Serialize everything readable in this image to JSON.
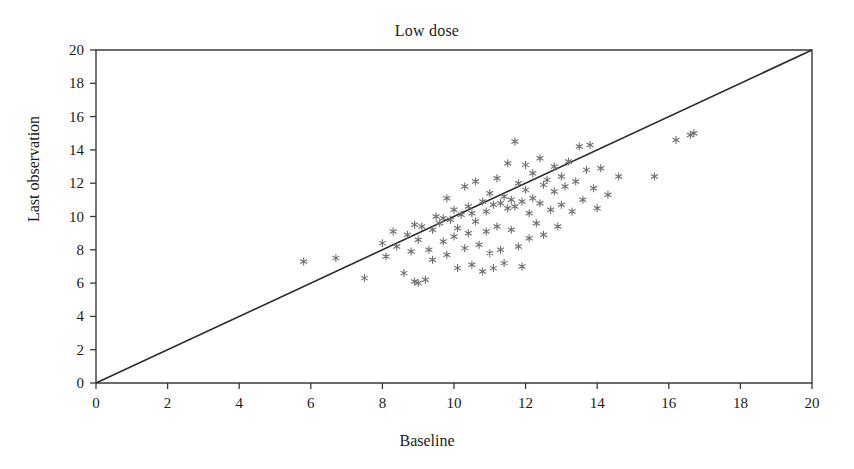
{
  "chart_data": {
    "type": "scatter",
    "title": "Low dose",
    "xlabel": "Baseline",
    "ylabel": "Last observation",
    "xlim": [
      0,
      20
    ],
    "ylim": [
      0,
      20
    ],
    "xticks": [
      0,
      2,
      4,
      6,
      8,
      10,
      12,
      14,
      16,
      18,
      20
    ],
    "yticks": [
      0,
      2,
      4,
      6,
      8,
      10,
      12,
      14,
      16,
      18,
      20
    ],
    "grid": false,
    "legend": null,
    "marker": "asterisk",
    "marker_color": "#6e6e6e",
    "line_color": "#2b2b2b",
    "axis_color": "#3a3a3a",
    "background_color": "#ffffff",
    "reference_line": {
      "description": "identity line y = x",
      "from": [
        0,
        0
      ],
      "to": [
        20,
        20
      ]
    },
    "points": [
      [
        5.8,
        7.3
      ],
      [
        6.7,
        7.5
      ],
      [
        7.5,
        6.3
      ],
      [
        8.0,
        8.4
      ],
      [
        8.1,
        7.6
      ],
      [
        8.3,
        9.1
      ],
      [
        8.4,
        8.2
      ],
      [
        8.6,
        6.6
      ],
      [
        8.7,
        8.9
      ],
      [
        8.8,
        7.9
      ],
      [
        8.9,
        9.5
      ],
      [
        8.9,
        6.1
      ],
      [
        9.0,
        6.0
      ],
      [
        9.0,
        8.6
      ],
      [
        9.1,
        9.4
      ],
      [
        9.2,
        6.2
      ],
      [
        9.3,
        8.0
      ],
      [
        9.4,
        9.2
      ],
      [
        9.4,
        7.4
      ],
      [
        9.5,
        10.0
      ],
      [
        9.6,
        9.6
      ],
      [
        9.7,
        8.5
      ],
      [
        9.7,
        9.9
      ],
      [
        9.8,
        11.1
      ],
      [
        9.8,
        7.7
      ],
      [
        9.9,
        9.8
      ],
      [
        10.0,
        10.4
      ],
      [
        10.0,
        8.8
      ],
      [
        10.1,
        6.9
      ],
      [
        10.1,
        9.3
      ],
      [
        10.2,
        10.1
      ],
      [
        10.3,
        11.8
      ],
      [
        10.3,
        8.1
      ],
      [
        10.4,
        10.6
      ],
      [
        10.4,
        9.0
      ],
      [
        10.5,
        7.1
      ],
      [
        10.5,
        10.2
      ],
      [
        10.6,
        12.1
      ],
      [
        10.6,
        9.7
      ],
      [
        10.7,
        8.3
      ],
      [
        10.8,
        10.9
      ],
      [
        10.8,
        6.7
      ],
      [
        10.9,
        10.3
      ],
      [
        10.9,
        9.1
      ],
      [
        11.0,
        11.4
      ],
      [
        11.0,
        7.8
      ],
      [
        11.1,
        10.7
      ],
      [
        11.1,
        6.9
      ],
      [
        11.2,
        12.3
      ],
      [
        11.2,
        9.4
      ],
      [
        11.3,
        10.8
      ],
      [
        11.3,
        8.0
      ],
      [
        11.4,
        11.2
      ],
      [
        11.4,
        7.2
      ],
      [
        11.5,
        10.5
      ],
      [
        11.5,
        13.2
      ],
      [
        11.6,
        9.2
      ],
      [
        11.6,
        11.0
      ],
      [
        11.7,
        14.5
      ],
      [
        11.7,
        10.6
      ],
      [
        11.8,
        8.2
      ],
      [
        11.8,
        12.0
      ],
      [
        11.9,
        10.9
      ],
      [
        11.9,
        7.0
      ],
      [
        12.0,
        11.6
      ],
      [
        12.0,
        13.1
      ],
      [
        12.1,
        10.2
      ],
      [
        12.1,
        8.7
      ],
      [
        12.2,
        12.6
      ],
      [
        12.2,
        11.1
      ],
      [
        12.3,
        9.6
      ],
      [
        12.4,
        13.5
      ],
      [
        12.4,
        10.8
      ],
      [
        12.5,
        11.9
      ],
      [
        12.5,
        8.9
      ],
      [
        12.6,
        12.2
      ],
      [
        12.7,
        10.4
      ],
      [
        12.8,
        13.0
      ],
      [
        12.8,
        11.5
      ],
      [
        12.9,
        9.4
      ],
      [
        13.0,
        12.4
      ],
      [
        13.0,
        10.7
      ],
      [
        13.1,
        11.8
      ],
      [
        13.2,
        13.3
      ],
      [
        13.3,
        10.3
      ],
      [
        13.4,
        12.1
      ],
      [
        13.5,
        14.2
      ],
      [
        13.6,
        11.0
      ],
      [
        13.7,
        12.8
      ],
      [
        13.8,
        14.3
      ],
      [
        13.9,
        11.7
      ],
      [
        14.0,
        10.5
      ],
      [
        14.1,
        12.9
      ],
      [
        14.3,
        11.3
      ],
      [
        14.6,
        12.4
      ],
      [
        15.6,
        12.4
      ],
      [
        16.2,
        14.6
      ],
      [
        16.6,
        14.9
      ],
      [
        16.7,
        15.0
      ]
    ]
  }
}
